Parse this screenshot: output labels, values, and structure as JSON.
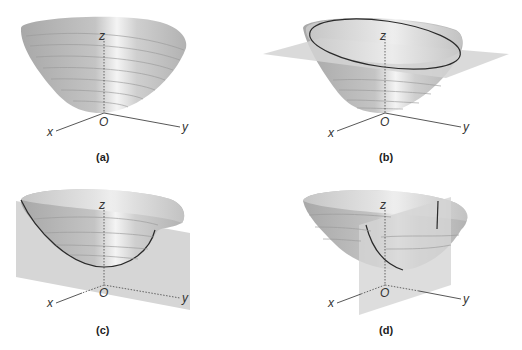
{
  "figure": {
    "colors": {
      "surface": "#b9b9b9",
      "surface_highlight": "#f2f2f2",
      "plane": "#d6d6d6",
      "curve": "#2a2a2a",
      "axis": "#444444"
    },
    "panels": [
      {
        "id": "a",
        "caption": "(a)",
        "axes": {
          "x": "x",
          "y": "y",
          "z": "z",
          "origin": "O"
        },
        "content": "paraboloid"
      },
      {
        "id": "b",
        "caption": "(b)",
        "axes": {
          "x": "x",
          "y": "y",
          "z": "z",
          "origin": "O"
        },
        "content": "paraboloid cut by horizontal plane, ellipse trace"
      },
      {
        "id": "c",
        "caption": "(c)",
        "axes": {
          "x": "x",
          "y": "y",
          "z": "z",
          "origin": "O"
        },
        "content": "paraboloid cut by vertical plane, parabola trace"
      },
      {
        "id": "d",
        "caption": "(d)",
        "axes": {
          "x": "x",
          "y": "y",
          "z": "z",
          "origin": "O"
        },
        "content": "paraboloid cut by vertical plane, parabola trace"
      }
    ]
  }
}
